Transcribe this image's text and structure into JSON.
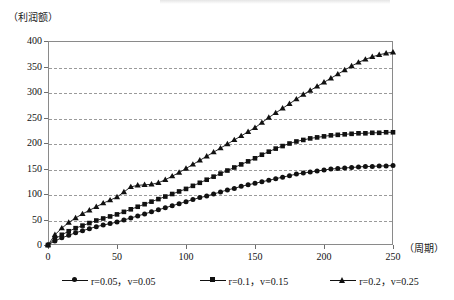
{
  "axes": {
    "y_axis_label": "（利润额）",
    "x_axis_label": "（周期）",
    "y_ticks": [
      "0",
      "50",
      "100",
      "150",
      "200",
      "250",
      "300",
      "350",
      "400"
    ],
    "x_ticks": [
      "0",
      "50",
      "100",
      "150",
      "200",
      "250"
    ]
  },
  "legend": {
    "items": [
      {
        "label": "r=0.05，v=0.05",
        "marker": "circle-marker-icon"
      },
      {
        "label": "r=0.1，v=0.15",
        "marker": "square-marker-icon"
      },
      {
        "label": "r=0.2，v=0.25",
        "marker": "triangle-marker-icon"
      }
    ]
  },
  "colors": {
    "series": "#111111",
    "grid": "#9a9a9a",
    "frame": "#8a8a8a",
    "text": "#111111",
    "background": "#ffffff"
  },
  "chart_data": {
    "type": "line",
    "title": "",
    "xlabel": "（周期）",
    "ylabel": "（利润额）",
    "xlim": [
      0,
      250
    ],
    "ylim": [
      0,
      400
    ],
    "xticks": [
      0,
      50,
      100,
      150,
      200,
      250
    ],
    "yticks": [
      0,
      50,
      100,
      150,
      200,
      250,
      300,
      350,
      400
    ],
    "grid": "horizontal-dashed",
    "legend_position": "bottom",
    "x": [
      0,
      5,
      10,
      15,
      20,
      25,
      30,
      35,
      40,
      45,
      50,
      55,
      60,
      65,
      70,
      75,
      80,
      85,
      90,
      95,
      100,
      105,
      110,
      115,
      120,
      125,
      130,
      135,
      140,
      145,
      150,
      155,
      160,
      165,
      170,
      175,
      180,
      185,
      190,
      195,
      200,
      205,
      210,
      215,
      220,
      225,
      230,
      235,
      240,
      245,
      250
    ],
    "series": [
      {
        "name": "r=0.05，v=0.05",
        "marker": "circle",
        "values": [
          0,
          8,
          14,
          19,
          24,
          28,
          32,
          36,
          39,
          42,
          45,
          49,
          53,
          57,
          61,
          65,
          69,
          73,
          77,
          81,
          85,
          89,
          93,
          96,
          100,
          104,
          108,
          111,
          115,
          118,
          121,
          124,
          127,
          130,
          133,
          136,
          139,
          141,
          143,
          145,
          147,
          149,
          150,
          151,
          152,
          153,
          154,
          154,
          155,
          155,
          156
        ]
      },
      {
        "name": "r=0.1，v=0.15",
        "marker": "square",
        "values": [
          0,
          12,
          20,
          27,
          33,
          38,
          43,
          48,
          52,
          56,
          60,
          65,
          70,
          75,
          80,
          85,
          90,
          95,
          100,
          105,
          110,
          116,
          122,
          128,
          134,
          140,
          146,
          152,
          158,
          164,
          170,
          177,
          183,
          189,
          194,
          199,
          203,
          206,
          209,
          211,
          213,
          215,
          216,
          217,
          218,
          219,
          219,
          220,
          220,
          221,
          221
        ]
      },
      {
        "name": "r=0.2，v=0.25",
        "marker": "triangle",
        "values": [
          0,
          20,
          33,
          44,
          53,
          61,
          68,
          75,
          82,
          88,
          94,
          104,
          114,
          117,
          118,
          119,
          122,
          128,
          135,
          142,
          150,
          158,
          166,
          174,
          182,
          190,
          198,
          206,
          214,
          222,
          230,
          240,
          250,
          259,
          268,
          277,
          286,
          295,
          303,
          311,
          319,
          327,
          335,
          343,
          351,
          358,
          364,
          369,
          373,
          376,
          378
        ]
      }
    ]
  }
}
